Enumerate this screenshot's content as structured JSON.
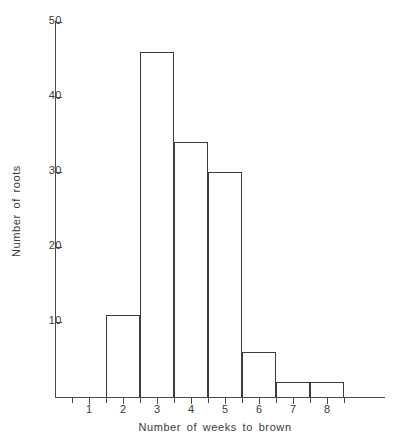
{
  "chart_data": {
    "type": "bar",
    "title": "",
    "xlabel": "Number  of  weeks  to  brown",
    "ylabel": "Number of roots",
    "categories": [
      "1",
      "2",
      "3",
      "4",
      "5",
      "6",
      "7",
      "8"
    ],
    "values": [
      0,
      11,
      46,
      34,
      30,
      6,
      2,
      2
    ],
    "series": [
      {
        "name": "Number of roots",
        "values": [
          0,
          11,
          46,
          34,
          30,
          6,
          2,
          2
        ]
      }
    ],
    "xlim": [
      0.5,
      8.5
    ],
    "ylim": [
      0,
      50
    ],
    "ytick_labels": [
      "10",
      "20",
      "30",
      "40",
      "50"
    ],
    "ytick_values": [
      10,
      20,
      30,
      40,
      50
    ],
    "xtick_labels": [
      "1",
      "2",
      "3",
      "4",
      "5",
      "6",
      "7",
      "8"
    ],
    "xtick_values": [
      1,
      2,
      3,
      4,
      5,
      6,
      7,
      8
    ],
    "grid": false,
    "legend": null,
    "bar_style": "outline",
    "colors": {
      "bar_outline": "#3c3c3c",
      "bar_fill": "transparent",
      "axis": "#4a4a4a",
      "text": "#3a3a3a",
      "background": "#ffffff"
    }
  },
  "axes": {
    "y_label_text": "Number of roots",
    "x_label_text": "Number  of  weeks  to  brown"
  }
}
